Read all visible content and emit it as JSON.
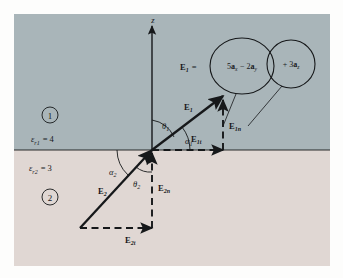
{
  "figure": {
    "axis": {
      "z_label": "z"
    },
    "regions": [
      {
        "id": "region-1",
        "marker": "1",
        "permittivity_label": "ε",
        "permittivity_sub": "r1",
        "permittivity_value": "= 4",
        "permittivity_full": "εr1 = 4",
        "color": "#a9b5b9"
      },
      {
        "id": "region-2",
        "marker": "2",
        "permittivity_label": "ε",
        "permittivity_sub": "r2",
        "permittivity_value": "= 3",
        "permittivity_full": "εr2 = 3",
        "color": "#e0d7d3"
      }
    ],
    "vectors": [
      {
        "name": "E1",
        "label": "E",
        "sub": "1"
      },
      {
        "name": "E1n",
        "label": "E",
        "sub": "1n"
      },
      {
        "name": "E1t",
        "label": "E",
        "sub": "1t"
      },
      {
        "name": "E2",
        "label": "E",
        "sub": "2"
      },
      {
        "name": "E2n",
        "label": "E",
        "sub": "2n"
      },
      {
        "name": "E2t",
        "label": "E",
        "sub": "2t"
      }
    ],
    "angles": [
      {
        "name": "theta1",
        "label": "θ",
        "sub": "1"
      },
      {
        "name": "alpha1",
        "label": "α",
        "sub": "1"
      },
      {
        "name": "alpha2",
        "label": "α",
        "sub": "2"
      },
      {
        "name": "theta2",
        "label": "θ",
        "sub": "2"
      }
    ],
    "equation": {
      "lhs": "E",
      "lhs_sub": "1",
      "equals": "=",
      "tangential_group": "5a",
      "tangential_group_sub1": "x",
      "tangential_group_mid": "− 2a",
      "tangential_group_sub2": "y",
      "normal_group": "+ 3a",
      "normal_group_sub": "z",
      "full_text": "E1 = 5ax − 2ay + 3az"
    }
  },
  "colors": {
    "region1_fill": "#a9b5b9",
    "region2_fill": "#e0d7d3",
    "ink": "#16181a",
    "page": "#fdfdfc"
  }
}
